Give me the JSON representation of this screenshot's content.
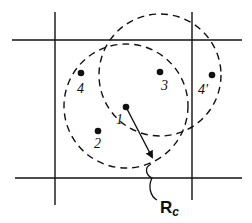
{
  "diagram": {
    "colors": {
      "stroke": "#111111",
      "background": "#ffffff"
    },
    "grid_lines": {
      "vertical": [
        {
          "x": 55,
          "y1": 12,
          "y2": 205
        },
        {
          "x": 192,
          "y1": 12,
          "y2": 200
        }
      ],
      "horizontal": [
        {
          "y": 40,
          "x1": 12,
          "x2": 242
        },
        {
          "y": 178,
          "x1": 15,
          "x2": 242
        }
      ]
    },
    "circles": [
      {
        "id": "cutoff-circle-particle-1",
        "cx": 126,
        "cy": 106,
        "r": 62,
        "style": "dashed"
      },
      {
        "id": "cutoff-circle-particle-3",
        "cx": 160,
        "cy": 75,
        "r": 61,
        "style": "dashed"
      }
    ],
    "particles": [
      {
        "id": "1",
        "label": "1",
        "x": 126,
        "y": 107,
        "lx": 116,
        "ly": 124
      },
      {
        "id": "2",
        "label": "2",
        "x": 98,
        "y": 131,
        "lx": 94,
        "ly": 148
      },
      {
        "id": "3",
        "label": "3",
        "x": 160,
        "y": 72,
        "lx": 161,
        "ly": 90
      },
      {
        "id": "4",
        "label": "4",
        "x": 81,
        "y": 73,
        "lx": 77,
        "ly": 93
      },
      {
        "id": "4p",
        "label": "4'",
        "x": 212,
        "y": 75,
        "lx": 198,
        "ly": 94
      }
    ],
    "arrow": {
      "x1": 126,
      "y1": 107,
      "x2": 152,
      "y2": 157
    },
    "radius_label": {
      "main": "R",
      "subscript": "c",
      "x": 160,
      "y": 213
    }
  }
}
